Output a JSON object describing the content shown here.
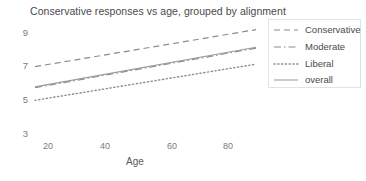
{
  "chart_data": {
    "type": "line",
    "title": "Conservative responses vs age, grouped by alignment",
    "xlabel": "Age",
    "ylabel": "",
    "xlim": [
      8,
      95
    ],
    "ylim": [
      2.2,
      9.8
    ],
    "xticks": [
      20,
      40,
      60,
      80
    ],
    "yticks": [
      3,
      5,
      7,
      9
    ],
    "grid": false,
    "legend_position": "upper right",
    "x": [
      13,
      90
    ],
    "series": [
      {
        "name": "Conservative",
        "linestyle": "dashed",
        "color": "#8c8c8c",
        "values": [
          7.0,
          9.2
        ]
      },
      {
        "name": "Moderate",
        "linestyle": "dashdot",
        "color": "#8c8c8c",
        "values": [
          5.75,
          8.1
        ]
      },
      {
        "name": "Liberal",
        "linestyle": "dotted",
        "color": "#8c8c8c",
        "values": [
          5.0,
          7.15
        ]
      },
      {
        "name": "overall",
        "linestyle": "solid",
        "color": "#9a9a9a",
        "values": [
          5.8,
          8.15
        ]
      }
    ]
  },
  "legend": {
    "items": [
      {
        "label": "Conservative",
        "style": "dashed"
      },
      {
        "label": "Moderate",
        "style": "dashdot"
      },
      {
        "label": "Liberal",
        "style": "dotted"
      },
      {
        "label": "overall",
        "style": "solid"
      }
    ]
  },
  "axes": {
    "ytick_labels": [
      "9",
      "7",
      "5",
      "3"
    ],
    "xtick_labels": [
      "20",
      "40",
      "60",
      "80"
    ],
    "xlabel": "Age"
  }
}
